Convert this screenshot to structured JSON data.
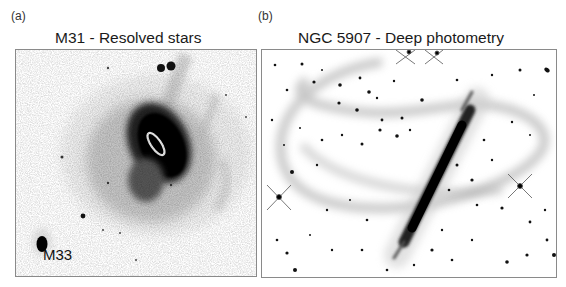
{
  "figure": {
    "panels": [
      {
        "letter": "(a)",
        "title": "M31 - Resolved stars",
        "annotations": [
          {
            "text": "M33",
            "target": "satellite-galaxy-m33"
          }
        ],
        "image_description": "Inverted greyscale star-count map of the Andromeda galaxy (M31) halo with dark central disk, white ellipse marking the inner disk, tidal streams, and companion galaxy M33 at lower left"
      },
      {
        "letter": "(b)",
        "title": "NGC 5907 - Deep photometry",
        "annotations": [],
        "image_description": "Inverted greyscale deep image of edge-on galaxy NGC 5907 with a dark diagonal disk and a faint looping tidal stream surrounding it, field stars scattered with diffraction spikes"
      }
    ],
    "colors": {
      "background": "#ffffff",
      "frame": "#8a8a8a",
      "ink": "#111111"
    }
  }
}
